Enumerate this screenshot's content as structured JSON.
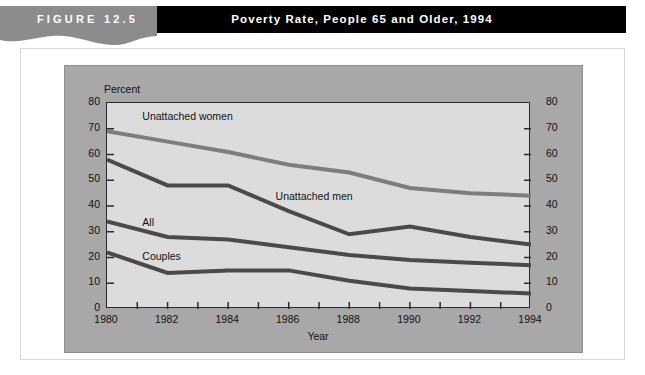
{
  "header": {
    "figure_label": "FIGURE 12.5",
    "title": "Poverty Rate, People 65 and Older, 1994",
    "banner_color": "#000000",
    "tab_color": "#8c8c8c"
  },
  "chart_data": {
    "type": "line",
    "title": "Poverty Rate, People 65 and Older, 1994",
    "xlabel": "Year",
    "ylabel": "Percent",
    "ylim": [
      0,
      80
    ],
    "xlim": [
      1980,
      1994
    ],
    "yticks": [
      0,
      10,
      20,
      30,
      40,
      50,
      60,
      70,
      80
    ],
    "ytick_labels": [
      "0",
      "10",
      "20",
      "30",
      "40",
      "50",
      "60",
      "70",
      "80"
    ],
    "xticks": [
      1980,
      1982,
      1984,
      1986,
      1988,
      1990,
      1992,
      1994
    ],
    "xtick_labels": [
      "1980",
      "1982",
      "1984",
      "1986",
      "1988",
      "1990",
      "1992",
      "1994"
    ],
    "x_minor_ticks": [
      1981,
      1983,
      1985,
      1987,
      1989,
      1991,
      1993
    ],
    "grid": false,
    "legend": "inline-labels",
    "x": [
      1980,
      1982,
      1984,
      1986,
      1988,
      1990,
      1992,
      1994
    ],
    "series": [
      {
        "name": "Unattached women",
        "color": "#7d7d7d",
        "values": [
          69,
          65,
          61,
          56,
          53,
          47,
          45,
          44
        ],
        "label_x": 1981.2,
        "label_y": 74
      },
      {
        "name": "Unattached men",
        "color": "#4a4a4a",
        "values": [
          58,
          48,
          48,
          38,
          29,
          32,
          28,
          25
        ],
        "label_x": 1985.6,
        "label_y": 43
      },
      {
        "name": "All",
        "color": "#4a4a4a",
        "values": [
          34,
          28,
          27,
          24,
          21,
          19,
          18,
          17
        ],
        "label_x": 1981.2,
        "label_y": 33
      },
      {
        "name": "Couples",
        "color": "#4a4a4a",
        "values": [
          22,
          14,
          15,
          15,
          11,
          8,
          7,
          6
        ],
        "label_x": 1981.2,
        "label_y": 20
      }
    ]
  }
}
